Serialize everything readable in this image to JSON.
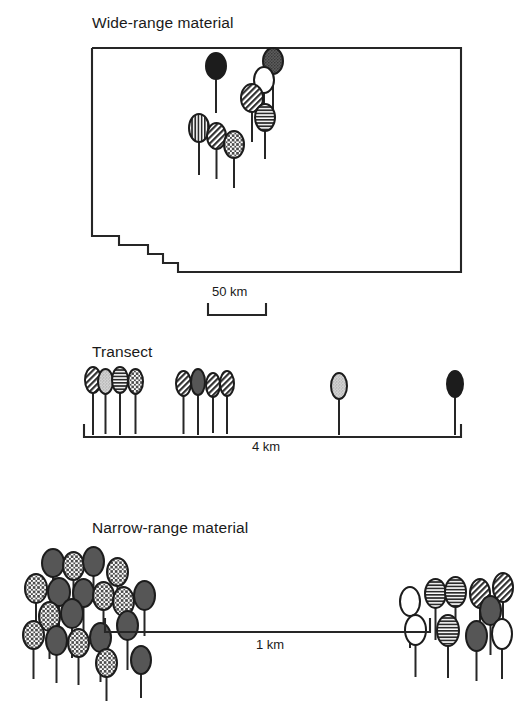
{
  "figure": {
    "kind": "three-panel-sampling-diagram",
    "background": "#ffffff",
    "ink": "#1a1a1a"
  },
  "palette": {
    "black": "#1c1c1c",
    "dark_gray": "#565656",
    "mid_gray": "#7e7e7e",
    "light_gray": "#c9c9c9",
    "white": "#ffffff",
    "line": "#262626"
  },
  "legend_patterns": {
    "solid_black": "solid black fill",
    "dark_stipple": "dark gray stippled fill",
    "gray_solid": "medium gray solid fill",
    "light_stipple": "light gray stippled fill",
    "vertical_lines": "vertical line hatch",
    "horizontal_lines": "horizontal line hatch",
    "diagonal_lines": "diagonal line hatch",
    "crosshatch": "cross-hatch / checkered fill",
    "white_open": "white open fill"
  },
  "panels": [
    {
      "id": "wide-range",
      "title": "Wide-range material",
      "scalebar": {
        "label": "50 km"
      },
      "map": {
        "description": "rectangular state outline with stair-step notch at lower left",
        "outline_points": "92,48 461,48 461,272 178,272 178,263 163,263 163,254 148,254 148,245 119,245 119,236 92,236"
      },
      "symbols": [
        {
          "x": 205,
          "y": 52,
          "w": 22,
          "h": 28,
          "stem": 34,
          "pattern": "solid_black"
        },
        {
          "x": 262,
          "y": 47,
          "w": 22,
          "h": 28,
          "stem": 36,
          "pattern": "dark_stipple"
        },
        {
          "x": 253,
          "y": 66,
          "w": 22,
          "h": 28,
          "stem": 30,
          "pattern": "white_open"
        },
        {
          "x": 240,
          "y": 83,
          "w": 24,
          "h": 30,
          "stem": 30,
          "pattern": "diagonal_lines"
        },
        {
          "x": 254,
          "y": 103,
          "w": 22,
          "h": 29,
          "stem": 28,
          "pattern": "horizontal_lines"
        },
        {
          "x": 188,
          "y": 113,
          "w": 22,
          "h": 30,
          "stem": 33,
          "pattern": "vertical_lines"
        },
        {
          "x": 206,
          "y": 122,
          "w": 21,
          "h": 28,
          "stem": 30,
          "pattern": "diagonal_lines"
        },
        {
          "x": 223,
          "y": 130,
          "w": 22,
          "h": 29,
          "stem": 30,
          "pattern": "crosshatch"
        }
      ]
    },
    {
      "id": "transect",
      "title": "Transect",
      "scalebar": {
        "label": "4 km"
      },
      "axis": {
        "description": "horizontal line with upward end ticks"
      },
      "symbols": [
        {
          "x": 84,
          "y": 366,
          "w": 18,
          "h": 28,
          "stem": 42,
          "pattern": "diagonal_lines"
        },
        {
          "x": 97,
          "y": 368,
          "w": 17,
          "h": 27,
          "stem": 40,
          "pattern": "light_stipple"
        },
        {
          "x": 111,
          "y": 366,
          "w": 18,
          "h": 28,
          "stem": 42,
          "pattern": "horizontal_lines"
        },
        {
          "x": 127,
          "y": 368,
          "w": 17,
          "h": 27,
          "stem": 40,
          "pattern": "crosshatch"
        },
        {
          "x": 175,
          "y": 370,
          "w": 17,
          "h": 27,
          "stem": 38,
          "pattern": "diagonal_lines"
        },
        {
          "x": 190,
          "y": 368,
          "w": 16,
          "h": 28,
          "stem": 40,
          "pattern": "gray_solid"
        },
        {
          "x": 205,
          "y": 372,
          "w": 16,
          "h": 26,
          "stem": 36,
          "pattern": "diagonal_lines"
        },
        {
          "x": 219,
          "y": 370,
          "w": 16,
          "h": 27,
          "stem": 38,
          "pattern": "diagonal_lines"
        },
        {
          "x": 330,
          "y": 372,
          "w": 18,
          "h": 28,
          "stem": 36,
          "pattern": "light_stipple"
        },
        {
          "x": 446,
          "y": 370,
          "w": 18,
          "h": 28,
          "stem": 38,
          "pattern": "solid_black"
        }
      ]
    },
    {
      "id": "narrow-range",
      "title": "Narrow-range material",
      "scalebar": {
        "label": "1 km"
      },
      "axis": {
        "description": "horizontal line with upward end ticks"
      },
      "symbols": [
        {
          "x": 41,
          "y": 548,
          "w": 24,
          "h": 30,
          "stem": 26,
          "pattern": "gray_solid"
        },
        {
          "x": 62,
          "y": 551,
          "w": 23,
          "h": 30,
          "stem": 24,
          "pattern": "crosshatch"
        },
        {
          "x": 82,
          "y": 546,
          "w": 23,
          "h": 31,
          "stem": 26,
          "pattern": "gray_solid"
        },
        {
          "x": 106,
          "y": 557,
          "w": 23,
          "h": 30,
          "stem": 22,
          "pattern": "crosshatch"
        },
        {
          "x": 24,
          "y": 573,
          "w": 24,
          "h": 31,
          "stem": 26,
          "pattern": "crosshatch"
        },
        {
          "x": 47,
          "y": 577,
          "w": 24,
          "h": 30,
          "stem": 24,
          "pattern": "gray_solid"
        },
        {
          "x": 72,
          "y": 578,
          "w": 23,
          "h": 30,
          "stem": 24,
          "pattern": "gray_solid"
        },
        {
          "x": 92,
          "y": 581,
          "w": 23,
          "h": 30,
          "stem": 22,
          "pattern": "crosshatch"
        },
        {
          "x": 112,
          "y": 586,
          "w": 23,
          "h": 31,
          "stem": 22,
          "pattern": "crosshatch"
        },
        {
          "x": 133,
          "y": 580,
          "w": 23,
          "h": 31,
          "stem": 26,
          "pattern": "gray_solid"
        },
        {
          "x": 38,
          "y": 601,
          "w": 23,
          "h": 31,
          "stem": 28,
          "pattern": "crosshatch"
        },
        {
          "x": 60,
          "y": 598,
          "w": 24,
          "h": 31,
          "stem": 30,
          "pattern": "gray_solid"
        },
        {
          "x": 22,
          "y": 620,
          "w": 23,
          "h": 30,
          "stem": 30,
          "pattern": "crosshatch"
        },
        {
          "x": 45,
          "y": 625,
          "w": 23,
          "h": 31,
          "stem": 28,
          "pattern": "gray_solid"
        },
        {
          "x": 67,
          "y": 628,
          "w": 23,
          "h": 30,
          "stem": 28,
          "pattern": "crosshatch"
        },
        {
          "x": 89,
          "y": 622,
          "w": 23,
          "h": 31,
          "stem": 30,
          "pattern": "gray_solid"
        },
        {
          "x": 116,
          "y": 610,
          "w": 23,
          "h": 31,
          "stem": 30,
          "pattern": "gray_solid"
        },
        {
          "x": 95,
          "y": 648,
          "w": 23,
          "h": 30,
          "stem": 24,
          "pattern": "crosshatch"
        },
        {
          "x": 130,
          "y": 645,
          "w": 22,
          "h": 30,
          "stem": 24,
          "pattern": "gray_solid"
        },
        {
          "x": 399,
          "y": 586,
          "w": 22,
          "h": 31,
          "stem": 32,
          "pattern": "white_open"
        },
        {
          "x": 424,
          "y": 578,
          "w": 23,
          "h": 31,
          "stem": 32,
          "pattern": "horizontal_lines"
        },
        {
          "x": 444,
          "y": 576,
          "w": 23,
          "h": 32,
          "stem": 34,
          "pattern": "horizontal_lines"
        },
        {
          "x": 469,
          "y": 578,
          "w": 22,
          "h": 31,
          "stem": 32,
          "pattern": "diagonal_lines"
        },
        {
          "x": 492,
          "y": 572,
          "w": 22,
          "h": 31,
          "stem": 32,
          "pattern": "diagonal_lines"
        },
        {
          "x": 479,
          "y": 595,
          "w": 23,
          "h": 31,
          "stem": 30,
          "pattern": "gray_solid"
        },
        {
          "x": 404,
          "y": 614,
          "w": 23,
          "h": 32,
          "stem": 32,
          "pattern": "white_open"
        },
        {
          "x": 436,
          "y": 614,
          "w": 24,
          "h": 33,
          "stem": 32,
          "pattern": "horizontal_lines"
        },
        {
          "x": 465,
          "y": 620,
          "w": 23,
          "h": 32,
          "stem": 30,
          "pattern": "gray_solid"
        },
        {
          "x": 491,
          "y": 618,
          "w": 22,
          "h": 32,
          "stem": 30,
          "pattern": "white_open"
        }
      ]
    }
  ]
}
